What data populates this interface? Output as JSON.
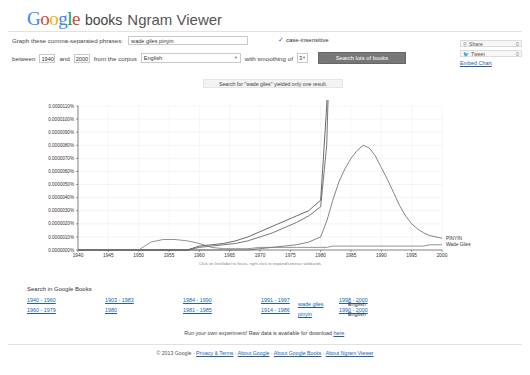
{
  "header": {
    "logo_g1": "G",
    "logo_o1": "o",
    "logo_o2": "o",
    "logo_g2": "g",
    "logo_l": "l",
    "logo_e": "e",
    "books": "books",
    "viewer": "Ngram Viewer"
  },
  "form": {
    "phrase_label": "Graph these comma-separated phrases:",
    "phrase_value": "wade giles pinyin",
    "phrase_placeholder": "",
    "case_insensitive": "case-insensitive",
    "check_icon": "check-icon",
    "between_label": "between",
    "year_start": "1940",
    "and_label": "and",
    "year_end": "2000",
    "corpus_label": "from the corpus",
    "corpus_value": "English",
    "smoothing_label": "with smoothing of",
    "smoothing_value": "3",
    "search_button": "Search lots of books"
  },
  "share": {
    "share_label": "Share",
    "share_count": "0",
    "tweet_label": "Tweet",
    "tweet_count": "0",
    "embed_label": "Embed Chart",
    "share_icon": "share-icon",
    "tweet_icon": "twitter-bird-icon"
  },
  "notice": {
    "text": "Search for \"wade giles\" yielded only one result."
  },
  "google_books": {
    "title": "Search in Google Books",
    "ranges": [
      [
        "1940 - 1960",
        "1903 - 1983",
        "1984 - 1990",
        "1991 - 1997",
        "1998 - 2000"
      ],
      [
        "1960 - 1979",
        "1980",
        "1981 - 1985",
        "1914 - 1986",
        "1990 - 2000"
      ]
    ],
    "terms": [
      "wade giles",
      "pinyin"
    ],
    "corpora": [
      "English",
      "English"
    ]
  },
  "experiment": {
    "prefix": "Run your own experiment! Raw data is available for download ",
    "link": "here",
    "suffix": "."
  },
  "footer": {
    "copyright": "© 2013 Google",
    "links": [
      "Privacy & Terms",
      "About Google",
      "About Google Books",
      "About Ngram Viewer"
    ],
    "separator": "-"
  },
  "chart_data": {
    "type": "line",
    "title": "",
    "xlabel": "",
    "ylabel": "",
    "xlim": [
      1940,
      2000
    ],
    "ylim": [
      0,
      1.1e-07
    ],
    "grid": true,
    "legend_position": "right-inline",
    "hint": "Click on line/label to focus, right click to expand/contract wildcards",
    "xticks": [
      "1940",
      "1945",
      "1950",
      "1955",
      "1960",
      "1965",
      "1970",
      "1975",
      "1980",
      "1985",
      "1990",
      "1995",
      "2000"
    ],
    "yticks": [
      "0.0000000%",
      "0.0000010%",
      "0.0000020%",
      "0.0000030%",
      "0.0000040%",
      "0.0000050%",
      "0.0000060%",
      "0.0000070%",
      "0.0000080%",
      "0.0000090%",
      "0.0000100%",
      "0.0000110%"
    ],
    "x": [
      1940,
      1942,
      1944,
      1946,
      1948,
      1950,
      1952,
      1954,
      1956,
      1958,
      1960,
      1962,
      1964,
      1966,
      1968,
      1970,
      1972,
      1974,
      1976,
      1978,
      1980,
      1981,
      1982,
      1983,
      1984,
      1985,
      1986,
      1987,
      1988,
      1989,
      1990,
      1991,
      1992,
      1993,
      1994,
      1995,
      1996,
      1997,
      1998,
      1999,
      2000
    ],
    "series": [
      {
        "name": "Pinyin",
        "label": "Pinyin",
        "color": "#444444",
        "values": [
          0,
          0,
          0,
          0,
          0,
          0,
          0,
          0,
          0,
          0,
          3e-09,
          4e-09,
          5e-09,
          7e-09,
          1e-08,
          1.4e-08,
          1.8e-08,
          2.2e-08,
          2.6e-08,
          3e-08,
          3.8e-08,
          1.1e-07,
          3.4e-07,
          6.4e-07,
          9.3e-07,
          9.55e-07,
          8.8e-07,
          8.4e-07,
          8.95e-07,
          8.4e-07,
          7.85e-07,
          7.65e-07,
          7.7e-07,
          7.55e-07,
          7.85e-07,
          7.6e-07,
          7.7e-07,
          7.8e-07,
          8e-07,
          8.55e-07,
          8.35e-07
        ]
      },
      {
        "name": "pinyin",
        "label": "pinyin",
        "color": "#555555",
        "values": [
          0,
          0,
          0,
          0,
          0,
          0,
          0,
          0,
          0,
          0,
          2e-09,
          3e-09,
          4e-09,
          5e-09,
          7e-09,
          1e-08,
          1.3e-08,
          1.7e-08,
          2.1e-08,
          2.6e-08,
          3.3e-08,
          8e-08,
          2.4e-07,
          4.8e-07,
          6.95e-07,
          7.2e-07,
          5.9e-07,
          5.45e-07,
          5.2e-07,
          5.05e-07,
          5.35e-07,
          5.3e-07,
          5.4e-07,
          5.9e-07,
          6.35e-07,
          6.7e-07,
          7.05e-07,
          7.35e-07,
          7.6e-07,
          7.9e-07,
          8.2e-07
        ]
      },
      {
        "name": "PINYIN",
        "label": "PINYIN",
        "color": "#666666",
        "values": [
          0,
          0,
          0,
          0,
          0,
          0,
          0,
          0,
          0,
          0,
          0,
          0,
          0,
          0,
          0,
          1e-09,
          2e-09,
          3e-09,
          4e-09,
          6e-09,
          1e-08,
          2.2e-08,
          3.8e-08,
          5.2e-08,
          6.2e-08,
          7e-08,
          7.6e-08,
          8e-08,
          7.8e-08,
          7.2e-08,
          6.3e-08,
          5.4e-08,
          4.4e-08,
          3.4e-08,
          2.6e-08,
          2e-08,
          1.6e-08,
          1.3e-08,
          1.1e-08,
          1e-08,
          9e-09
        ]
      },
      {
        "name": "Wade Giles",
        "label": "Wade Giles",
        "color": "#777777",
        "values": [
          0,
          0,
          0,
          0,
          0,
          0,
          6e-09,
          8e-09,
          8e-09,
          7e-09,
          5e-09,
          2e-09,
          1e-09,
          1e-09,
          1e-09,
          2e-09,
          2e-09,
          2e-09,
          2e-09,
          2e-09,
          2e-09,
          2e-09,
          3e-09,
          3e-09,
          3e-09,
          3e-09,
          3e-09,
          3e-09,
          3e-09,
          3e-09,
          3e-09,
          3e-09,
          3e-09,
          3e-09,
          3e-09,
          3e-09,
          3e-09,
          3e-09,
          4e-09,
          4e-09,
          4e-09
        ]
      }
    ]
  }
}
